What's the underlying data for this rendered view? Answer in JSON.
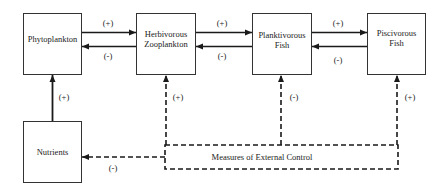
{
  "diagram": {
    "nodes": {
      "phytoplankton": {
        "lines": [
          "Phytoplankton"
        ]
      },
      "herbivorous_zooplankton": {
        "lines": [
          "Herbivorous",
          "Zooplankton"
        ]
      },
      "planktivorous_fish": {
        "lines": [
          "Planktivorous",
          "Fish"
        ]
      },
      "piscivorous_fish": {
        "lines": [
          "Piscivorous",
          "Fish"
        ]
      },
      "nutrients": {
        "lines": [
          "Nutrients"
        ]
      },
      "external_control": {
        "lines": [
          "Measures of External Control"
        ]
      }
    },
    "edges": {
      "phyto_to_zoo": {
        "label": "(+)",
        "style": "solid"
      },
      "zoo_to_phyto": {
        "label": "(-)",
        "style": "solid"
      },
      "zoo_to_plank": {
        "label": "(+)",
        "style": "solid"
      },
      "plank_to_zoo": {
        "label": "(-)",
        "style": "solid"
      },
      "plank_to_pisc": {
        "label": "(+)",
        "style": "solid"
      },
      "pisc_to_plank": {
        "label": "(-)",
        "style": "solid"
      },
      "nutrients_to_phyto": {
        "label": "(+)",
        "style": "solid"
      },
      "control_to_zoo": {
        "label": "(+)",
        "style": "dashed"
      },
      "control_to_plank": {
        "label": "(-)",
        "style": "dashed"
      },
      "control_to_pisc": {
        "label": "(+)",
        "style": "dashed"
      },
      "control_to_nutrients": {
        "label": "(-)",
        "style": "dashed"
      }
    }
  }
}
